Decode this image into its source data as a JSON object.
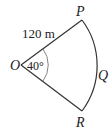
{
  "diagram": {
    "type": "sector",
    "points": {
      "center": "O",
      "top": "P",
      "arc_mid": "Q",
      "bottom": "R"
    },
    "radius_label": "120 m",
    "angle_label": "40°",
    "colors": {
      "stroke": "#333333",
      "angle_arc": "#777777",
      "text": "#222222"
    }
  }
}
